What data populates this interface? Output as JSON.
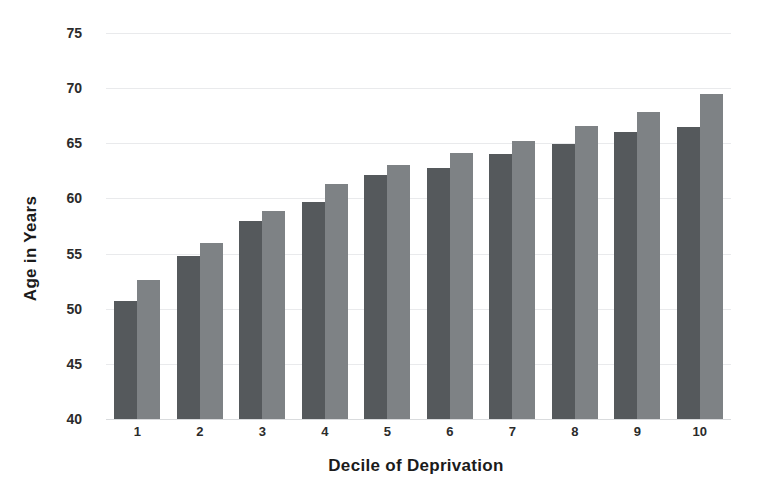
{
  "chart_data": {
    "type": "bar",
    "title": "",
    "xlabel": "Decile of Deprivation",
    "ylabel": "Age in Years",
    "categories": [
      "1",
      "2",
      "3",
      "4",
      "5",
      "6",
      "7",
      "8",
      "9",
      "10"
    ],
    "ylim": [
      40,
      75
    ],
    "yticks": [
      40,
      45,
      50,
      55,
      60,
      65,
      70,
      75
    ],
    "ytick_labels": [
      "40",
      "45",
      "50",
      "55",
      "60",
      "65",
      "70",
      "75"
    ],
    "grid": true,
    "legend": "none",
    "series": [
      {
        "name": "series-a",
        "color": "#55595c",
        "values": [
          50.7,
          54.8,
          58.0,
          59.7,
          62.1,
          62.8,
          64.0,
          64.9,
          66.0,
          66.5
        ]
      },
      {
        "name": "series-b",
        "color": "#7e8285",
        "values": [
          52.6,
          56.0,
          58.9,
          61.3,
          63.0,
          64.1,
          65.2,
          66.6,
          67.8,
          69.5
        ]
      }
    ]
  },
  "colors": {
    "series_a": "#55595c",
    "series_b": "#7e8285",
    "gridline": "#e9eaec",
    "text": "#1b1b1b",
    "background": "#ffffff"
  }
}
